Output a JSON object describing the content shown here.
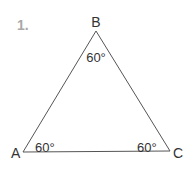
{
  "problem": {
    "number": "1."
  },
  "triangle": {
    "vertices": [
      {
        "name": "A",
        "x": 23,
        "y": 152
      },
      {
        "name": "B",
        "x": 96,
        "y": 31
      },
      {
        "name": "C",
        "x": 170,
        "y": 151
      }
    ],
    "angles": {
      "A": "60°",
      "B": "60°",
      "C": "60°"
    },
    "stroke_color": "#555555"
  }
}
